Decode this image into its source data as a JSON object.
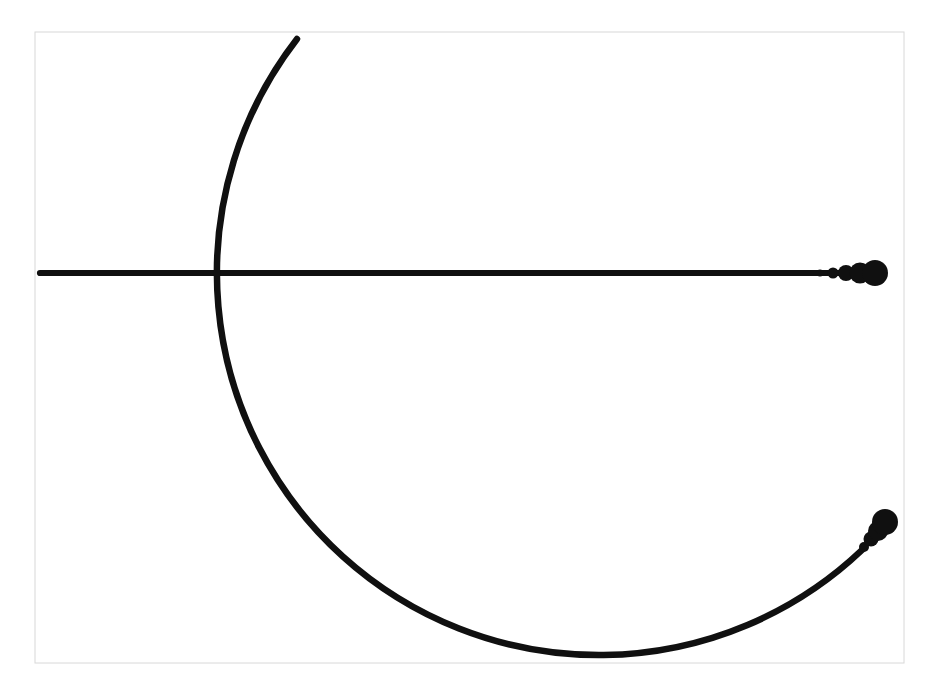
{
  "canvas": {
    "width": 932,
    "height": 691,
    "background": "#ffffff"
  },
  "frame": {
    "x": 35,
    "y": 32,
    "width": 869,
    "height": 631,
    "border_color": "#d8d8d8",
    "border_width": 1,
    "fill": "#ffffff"
  },
  "figure": {
    "ink_color": "#101010",
    "horizontal_line": {
      "x1": 40,
      "y": 273,
      "x2": 862,
      "thickness": 6.2,
      "end_blob_circles": [
        [
          820,
          273,
          3.5
        ],
        [
          833,
          273,
          5.5
        ],
        [
          846,
          273,
          8
        ],
        [
          860,
          273,
          10.5
        ],
        [
          875,
          273,
          13
        ]
      ]
    },
    "arc": {
      "type": "circular",
      "cx": 597,
      "cy": 275,
      "r": 382,
      "start": [
        297,
        39
      ],
      "end": [
        862,
        550
      ],
      "large_arc_flag": 0,
      "sweep_flag": 0,
      "thickness": 6.5,
      "end_blob_circles": [
        [
          864,
          547,
          5
        ],
        [
          871,
          539,
          7.5
        ],
        [
          878,
          531,
          10
        ],
        [
          885,
          522,
          13
        ]
      ]
    }
  }
}
